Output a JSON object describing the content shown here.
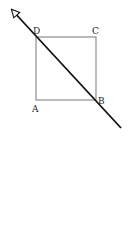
{
  "diagram": {
    "square": {
      "vertices": {
        "A": {
          "label": "A",
          "x": 36,
          "y": 100
        },
        "B": {
          "label": "B",
          "x": 96,
          "y": 100
        },
        "C": {
          "label": "C",
          "x": 96,
          "y": 37
        },
        "D": {
          "label": "D",
          "x": 36,
          "y": 37
        }
      },
      "stroke": "#555555"
    },
    "arrow_line": {
      "from": {
        "x": 121,
        "y": 128
      },
      "to": {
        "x": 8,
        "y": 6
      },
      "passes_through": [
        "D",
        "B"
      ],
      "arrowhead": "open-triangle",
      "stroke": "#111111"
    }
  }
}
